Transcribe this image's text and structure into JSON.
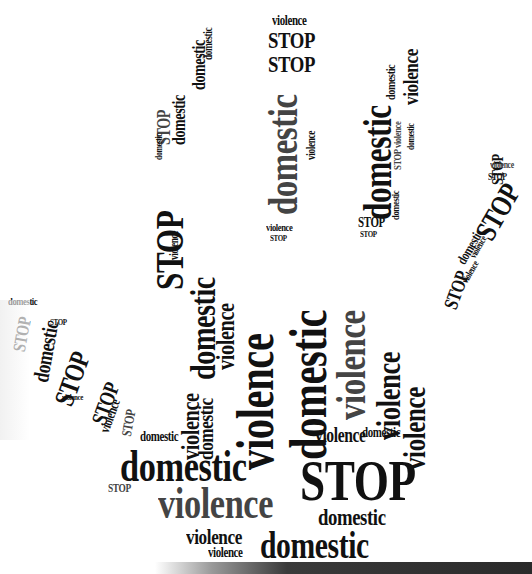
{
  "image": {
    "title": "STOP domestic violence",
    "shape": "hand",
    "colors": {
      "text": "#111111",
      "gray_text": "#444444",
      "background": "#ffffff",
      "bottom_bar": "#2a2a2a"
    }
  },
  "words": [
    {
      "t": "violence",
      "x": 272,
      "y": 14,
      "s": 14,
      "r": 0
    },
    {
      "t": "STOP",
      "x": 268,
      "y": 28,
      "s": 24,
      "r": 0
    },
    {
      "t": "STOP",
      "x": 268,
      "y": 52,
      "s": 24,
      "r": 0
    },
    {
      "t": "domestic",
      "x": 262,
      "y": 215,
      "s": 42,
      "r": -90
    },
    {
      "t": "violence",
      "x": 305,
      "y": 160,
      "s": 12,
      "r": -90
    },
    {
      "t": "violence",
      "x": 266,
      "y": 222,
      "s": 11,
      "r": 0
    },
    {
      "t": "STOP",
      "x": 270,
      "y": 234,
      "s": 9,
      "r": 0
    },
    {
      "t": "domestic",
      "x": 358,
      "y": 220,
      "s": 40,
      "r": -90
    },
    {
      "t": "violence",
      "x": 400,
      "y": 105,
      "s": 22,
      "r": -90
    },
    {
      "t": "domestic",
      "x": 384,
      "y": 100,
      "s": 13,
      "r": -90
    },
    {
      "t": "STOP violence",
      "x": 392,
      "y": 170,
      "s": 11,
      "r": -90
    },
    {
      "t": "domestic",
      "x": 406,
      "y": 150,
      "s": 10,
      "r": -90
    },
    {
      "t": "domestic",
      "x": 390,
      "y": 220,
      "s": 11,
      "r": -90
    },
    {
      "t": "STOP",
      "x": 358,
      "y": 216,
      "s": 14,
      "r": 0
    },
    {
      "t": "STOP",
      "x": 360,
      "y": 230,
      "s": 9,
      "r": 0
    },
    {
      "t": "STOP",
      "x": 150,
      "y": 290,
      "s": 40,
      "r": -90
    },
    {
      "t": "domestic",
      "x": 170,
      "y": 145,
      "s": 18,
      "r": -90
    },
    {
      "t": "STOP",
      "x": 155,
      "y": 145,
      "s": 18,
      "r": -90
    },
    {
      "t": "domestic",
      "x": 190,
      "y": 90,
      "s": 18,
      "r": -90
    },
    {
      "t": "domestic",
      "x": 202,
      "y": 60,
      "s": 12,
      "r": -90
    },
    {
      "t": "domestic",
      "x": 154,
      "y": 160,
      "s": 10,
      "r": -90
    },
    {
      "t": "violence",
      "x": 168,
      "y": 260,
      "s": 12,
      "r": -90
    },
    {
      "t": "STOP",
      "x": 470,
      "y": 230,
      "s": 30,
      "r": -60
    },
    {
      "t": "STOP",
      "x": 490,
      "y": 185,
      "s": 16,
      "r": -90
    },
    {
      "t": "violence",
      "x": 490,
      "y": 160,
      "s": 10,
      "r": 0
    },
    {
      "t": "STOP",
      "x": 488,
      "y": 172,
      "s": 10,
      "r": 0
    },
    {
      "t": "domestic",
      "x": 455,
      "y": 260,
      "s": 14,
      "r": -60
    },
    {
      "t": "violence",
      "x": 460,
      "y": 280,
      "s": 10,
      "r": -60
    },
    {
      "t": "STOP",
      "x": 440,
      "y": 305,
      "s": 20,
      "r": -70
    },
    {
      "t": "violence",
      "x": 468,
      "y": 255,
      "s": 10,
      "r": -60
    },
    {
      "t": "domestic",
      "x": 8,
      "y": 296,
      "s": 11,
      "r": 0
    },
    {
      "t": "STOP",
      "x": 10,
      "y": 350,
      "s": 18,
      "r": -80
    },
    {
      "t": "domestic",
      "x": 30,
      "y": 380,
      "s": 22,
      "r": -80
    },
    {
      "t": "STOP",
      "x": 50,
      "y": 400,
      "s": 28,
      "r": -70
    },
    {
      "t": "STOP",
      "x": 50,
      "y": 318,
      "s": 9,
      "r": 0
    },
    {
      "t": "violence",
      "x": 62,
      "y": 393,
      "s": 9,
      "r": 0
    },
    {
      "t": "STOP",
      "x": 88,
      "y": 420,
      "s": 22,
      "r": -70
    },
    {
      "t": "violence",
      "x": 98,
      "y": 430,
      "s": 14,
      "r": -70
    },
    {
      "t": "STOP",
      "x": 120,
      "y": 435,
      "s": 14,
      "r": -80
    },
    {
      "t": "domestic",
      "x": 185,
      "y": 380,
      "s": 36,
      "r": -90
    },
    {
      "t": "violence",
      "x": 213,
      "y": 370,
      "s": 26,
      "r": -90
    },
    {
      "t": "violence",
      "x": 178,
      "y": 460,
      "s": 26,
      "r": -90
    },
    {
      "t": "domestic",
      "x": 195,
      "y": 460,
      "s": 22,
      "r": -90
    },
    {
      "t": "violence",
      "x": 230,
      "y": 470,
      "s": 52,
      "r": -90
    },
    {
      "t": "domestic",
      "x": 283,
      "y": 460,
      "s": 52,
      "r": -90
    },
    {
      "t": "violence",
      "x": 330,
      "y": 420,
      "s": 42,
      "r": -90
    },
    {
      "t": "violence",
      "x": 372,
      "y": 440,
      "s": 34,
      "r": -90
    },
    {
      "t": "violence",
      "x": 398,
      "y": 470,
      "s": 32,
      "r": -90
    },
    {
      "t": "violence",
      "x": 315,
      "y": 425,
      "s": 20,
      "r": 0
    },
    {
      "t": "domestic",
      "x": 362,
      "y": 426,
      "s": 14,
      "r": 0
    },
    {
      "t": "domestic",
      "x": 140,
      "y": 430,
      "s": 14,
      "r": 0
    },
    {
      "t": "domestic",
      "x": 120,
      "y": 445,
      "s": 44,
      "r": 0
    },
    {
      "t": "violence",
      "x": 158,
      "y": 482,
      "s": 44,
      "r": 0
    },
    {
      "t": "STOP",
      "x": 300,
      "y": 452,
      "s": 58,
      "r": 0
    },
    {
      "t": "domestic",
      "x": 318,
      "y": 505,
      "s": 24,
      "r": 0
    },
    {
      "t": "violence",
      "x": 186,
      "y": 526,
      "s": 22,
      "r": 0
    },
    {
      "t": "violence",
      "x": 208,
      "y": 546,
      "s": 14,
      "r": 0
    },
    {
      "t": "domestic",
      "x": 260,
      "y": 526,
      "s": 38,
      "r": 0
    },
    {
      "t": "domestic",
      "x": 328,
      "y": 560,
      "s": 11,
      "r": 0
    },
    {
      "t": "STOP",
      "x": 108,
      "y": 482,
      "s": 12,
      "r": 0
    }
  ],
  "footer_bar": {
    "visible": true
  }
}
